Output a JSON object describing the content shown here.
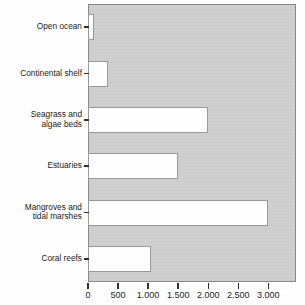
{
  "chart_data": {
    "type": "bar",
    "orientation": "horizontal",
    "title": "",
    "xlabel": "",
    "ylabel": "",
    "categories": [
      "Open ocean",
      "Continental shelf",
      "Seagrass and\nalgae beds",
      "Estuaries",
      "Mangroves and\ntidal marshes",
      "Coral reefs"
    ],
    "values": [
      100,
      330,
      2000,
      1500,
      3000,
      1050
    ],
    "xlim": [
      0,
      3460
    ],
    "xticks": [
      0,
      500,
      1000,
      1500,
      2000,
      2500,
      3000
    ],
    "xticklabels": [
      "0",
      "500",
      "1.000",
      "1.500",
      "2.000",
      "2.500",
      "3.000"
    ],
    "grid": false,
    "legend": null,
    "colors": {
      "plot_background": "#cfcfcf",
      "bar_fill": "#ffffff",
      "bar_border": "#9a9a9a",
      "axis": "#303030",
      "text": "#1c1c1c",
      "page_background": "#ffffff"
    }
  }
}
